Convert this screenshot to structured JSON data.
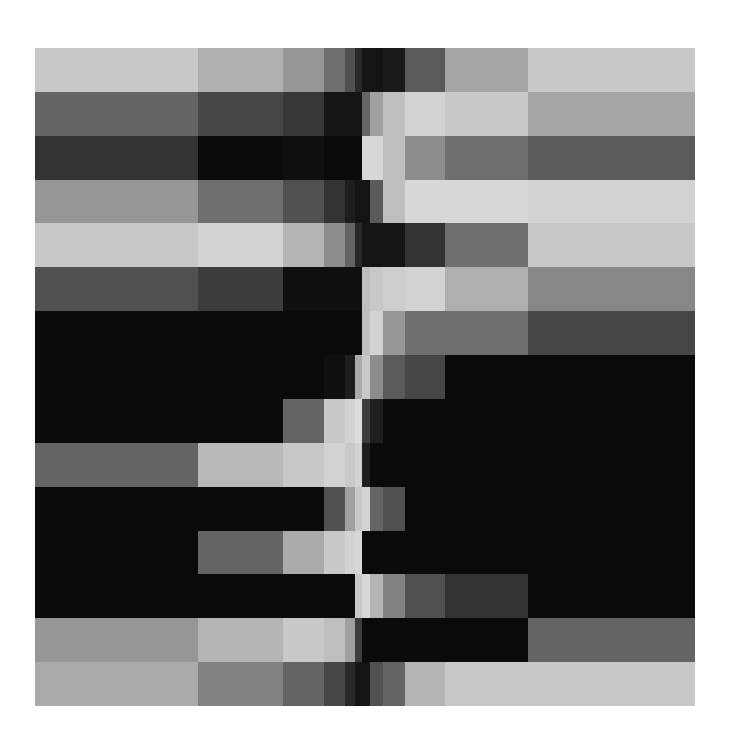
{
  "chart_data": {
    "type": "heatmap",
    "title": "",
    "xlabel": "",
    "ylabel": "",
    "colormap": "grayscale",
    "value_range": [
      0,
      255
    ],
    "column_bins": [
      {
        "from": 0,
        "to": 163
      },
      {
        "from": 163,
        "to": 248
      },
      {
        "from": 248,
        "to": 289
      },
      {
        "from": 289,
        "to": 310
      },
      {
        "from": 310,
        "to": 320
      },
      {
        "from": 320,
        "to": 327
      },
      {
        "from": 327,
        "to": 335
      },
      {
        "from": 335,
        "to": 348
      },
      {
        "from": 348,
        "to": 370
      },
      {
        "from": 370,
        "to": 410
      },
      {
        "from": 410,
        "to": 493
      },
      {
        "from": 493,
        "to": 660
      }
    ],
    "rows": [
      [
        200,
        175,
        150,
        110,
        80,
        40,
        20,
        20,
        25,
        90,
        165,
        200
      ],
      [
        100,
        70,
        55,
        20,
        20,
        20,
        100,
        160,
        190,
        210,
        200,
        165
      ],
      [
        50,
        10,
        15,
        10,
        10,
        10,
        215,
        215,
        190,
        140,
        110,
        90
      ],
      [
        150,
        110,
        80,
        50,
        30,
        20,
        20,
        90,
        190,
        215,
        215,
        210
      ],
      [
        200,
        210,
        180,
        140,
        100,
        40,
        20,
        20,
        20,
        50,
        110,
        200
      ],
      [
        80,
        60,
        15,
        15,
        15,
        15,
        190,
        200,
        205,
        210,
        175,
        135
      ],
      [
        10,
        10,
        10,
        10,
        10,
        10,
        190,
        210,
        150,
        110,
        110,
        70
      ],
      [
        10,
        10,
        10,
        15,
        30,
        170,
        200,
        140,
        90,
        70,
        10,
        10
      ],
      [
        10,
        10,
        100,
        200,
        210,
        220,
        60,
        30,
        10,
        10,
        10,
        10
      ],
      [
        100,
        185,
        200,
        210,
        200,
        210,
        30,
        10,
        10,
        10,
        10,
        10
      ],
      [
        10,
        10,
        10,
        80,
        160,
        200,
        210,
        100,
        80,
        10,
        10,
        10
      ],
      [
        10,
        100,
        170,
        200,
        210,
        215,
        10,
        10,
        10,
        10,
        10,
        10
      ],
      [
        10,
        10,
        10,
        10,
        10,
        200,
        215,
        180,
        130,
        80,
        50,
        10
      ],
      [
        150,
        180,
        200,
        190,
        160,
        60,
        10,
        10,
        10,
        10,
        10,
        100
      ],
      [
        170,
        130,
        100,
        70,
        40,
        20,
        20,
        80,
        100,
        180,
        200,
        200
      ]
    ]
  }
}
